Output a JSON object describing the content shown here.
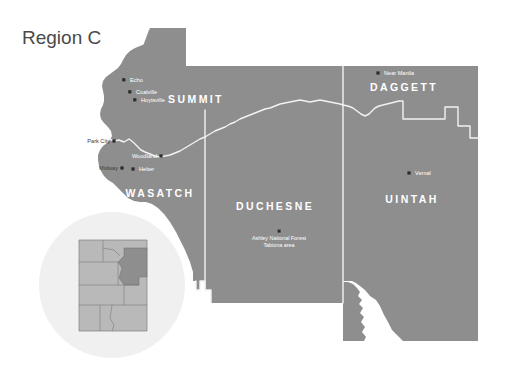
{
  "title": "Region C",
  "colors": {
    "background": "#ffffff",
    "region_fill": "#8e8e8e",
    "boundary_line": "#f2f2f2",
    "title_text": "#4a4a4a",
    "county_label": "#ffffff",
    "city_label_light": "#ffffff",
    "city_label_dark": "#3d3d3d",
    "dot": "#2b2b2b",
    "inset_circle": "#f0f0f0",
    "inset_state_fill": "#b9b9b9",
    "inset_highlight_fill": "#8e8e8e",
    "inset_state_line": "#6e6e6e"
  },
  "counties": [
    {
      "name": "SUMMIT",
      "x": 196,
      "y": 103
    },
    {
      "name": "DAGGETT",
      "x": 404,
      "y": 91
    },
    {
      "name": "WASATCH",
      "x": 160,
      "y": 197
    },
    {
      "name": "DUCHESNE",
      "x": 275,
      "y": 210
    },
    {
      "name": "UINTAH",
      "x": 412,
      "y": 203
    }
  ],
  "cities": [
    {
      "name": "Echo",
      "dot_x": 124,
      "dot_y": 80,
      "label_x": 130,
      "label_y": 82,
      "anchor": "start",
      "style": "light"
    },
    {
      "name": "Coalville",
      "dot_x": 130,
      "dot_y": 92,
      "label_x": 136,
      "label_y": 94,
      "anchor": "start",
      "style": "light"
    },
    {
      "name": "Hoytsville",
      "dot_x": 135,
      "dot_y": 100,
      "label_x": 141,
      "label_y": 102,
      "anchor": "start",
      "style": "light"
    },
    {
      "name": "Park City",
      "dot_x": 114,
      "dot_y": 141,
      "label_x": 110,
      "label_y": 143,
      "anchor": "end",
      "style": "dark"
    },
    {
      "name": "Woodland",
      "dot_x": 161,
      "dot_y": 156,
      "label_x": 157,
      "label_y": 158,
      "anchor": "end",
      "style": "light"
    },
    {
      "name": "Midway",
      "dot_x": 122,
      "dot_y": 168,
      "label_x": 118,
      "label_y": 170,
      "anchor": "end",
      "style": "dark"
    },
    {
      "name": "Heber",
      "dot_x": 133,
      "dot_y": 169,
      "label_x": 139,
      "label_y": 171,
      "anchor": "start",
      "style": "light"
    },
    {
      "name": "Near Manila",
      "dot_x": 378,
      "dot_y": 73,
      "label_x": 384,
      "label_y": 75,
      "anchor": "start",
      "style": "light"
    },
    {
      "name": "Vernal",
      "dot_x": 409,
      "dot_y": 173,
      "label_x": 415,
      "label_y": 175,
      "anchor": "start",
      "style": "light"
    }
  ],
  "points_of_interest": [
    {
      "dot_x": 279,
      "dot_y": 231,
      "label_x": 279,
      "label_y": 241,
      "lines": [
        "Ashley National Forest",
        "Tabiona area"
      ]
    }
  ],
  "inset": {
    "center_x": 112,
    "center_y": 285,
    "radius": 73,
    "description": "Utah state locator with northeast region highlighted"
  }
}
